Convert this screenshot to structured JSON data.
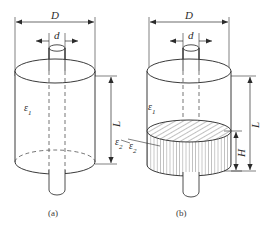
{
  "figure": {
    "type": "engineering-diagram",
    "background_color": "#ffffff",
    "line_color": "#3a3a3a",
    "dimension_color": "#2b2b2b",
    "hatch_color": "#4a4a4a"
  },
  "panels": [
    {
      "id": "a",
      "caption": "(a)",
      "description": "Cylinder with single dielectric and central rod",
      "dimensions": [
        {
          "name": "D",
          "label": "D",
          "orientation": "horizontal",
          "position": "top"
        },
        {
          "name": "d",
          "label": "d",
          "orientation": "horizontal",
          "position": "top-inner"
        },
        {
          "name": "L",
          "label": "L",
          "orientation": "vertical",
          "position": "right"
        }
      ],
      "materials": [
        {
          "name": "epsilon-1",
          "symbol": "ε",
          "subscript": "1",
          "region": "cylinder-body"
        },
        {
          "name": "epsilon-2",
          "symbol": "ε",
          "subscript": "2",
          "region": "outer-leader"
        }
      ]
    },
    {
      "id": "b",
      "caption": "(b)",
      "description": "Cylinder with two stacked dielectrics, lower one hatched",
      "dimensions": [
        {
          "name": "D",
          "label": "D",
          "orientation": "horizontal",
          "position": "top"
        },
        {
          "name": "d",
          "label": "d",
          "orientation": "horizontal",
          "position": "top-inner"
        },
        {
          "name": "L",
          "label": "L",
          "orientation": "vertical",
          "position": "right-outer"
        },
        {
          "name": "H",
          "label": "H",
          "orientation": "vertical",
          "position": "right-inner"
        }
      ],
      "materials": [
        {
          "name": "epsilon-1",
          "symbol": "ε",
          "subscript": "1",
          "region": "upper-cylinder"
        },
        {
          "name": "epsilon-2",
          "symbol": "ε",
          "subscript": "2",
          "region": "lower-hatched-disc"
        }
      ]
    }
  ],
  "labels": {
    "a_D": "D",
    "a_d": "d",
    "a_L": "L",
    "a_eps1_sym": "ε",
    "a_eps1_sub": "1",
    "a_eps2_sym": "ε",
    "a_eps2_sub": "2",
    "a_caption": "(a)",
    "b_D": "D",
    "b_d": "d",
    "b_L": "L",
    "b_H": "H",
    "b_eps1_sym": "ε",
    "b_eps1_sub": "1",
    "b_eps2_sym": "ε",
    "b_eps2_sub": "2",
    "b_caption": "(b)"
  }
}
